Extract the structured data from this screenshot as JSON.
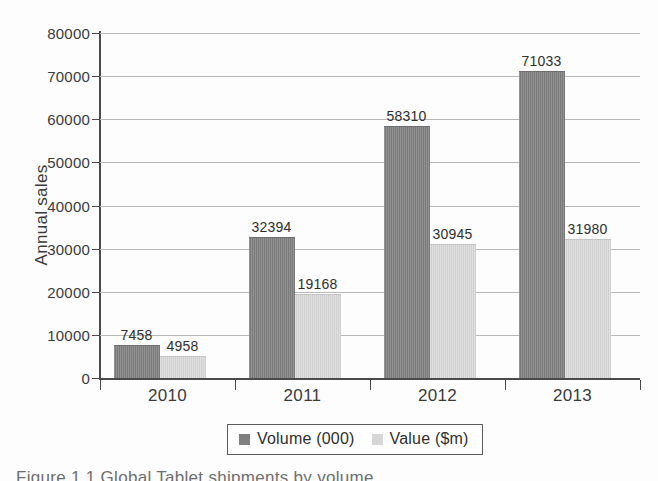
{
  "chart_data": {
    "type": "bar",
    "title": "",
    "xlabel": "",
    "ylabel": "Annual sales",
    "categories": [
      "2010",
      "2011",
      "2012",
      "2013"
    ],
    "series": [
      {
        "name": "Volume (000)",
        "color": "#808080",
        "values": [
          7458,
          32394,
          58310,
          71033
        ]
      },
      {
        "name": "Value ($m)",
        "color": "#d6d6d6",
        "values": [
          4958,
          19168,
          30945,
          31980
        ]
      }
    ],
    "ylim": [
      0,
      80000
    ],
    "ytick_step": 10000,
    "yticks": [
      "0",
      "10000",
      "20000",
      "30000",
      "40000",
      "50000",
      "60000",
      "70000",
      "80000"
    ],
    "grid": true,
    "grid_axis": "y",
    "legend_position": "bottom",
    "data_labels": true
  },
  "legend": {
    "items": [
      {
        "label": "Volume (000)",
        "swatch": "volume"
      },
      {
        "label": "Value ($m)",
        "swatch": "value"
      }
    ]
  },
  "caption": {
    "text": "Figure 1.1 Global Tablet shipments by volume"
  }
}
